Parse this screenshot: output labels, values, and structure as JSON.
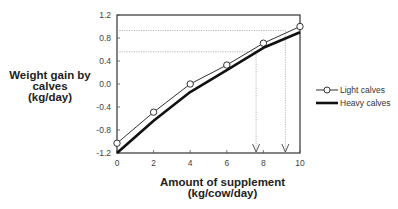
{
  "chart_data": {
    "type": "line",
    "title": "",
    "xlabel": "Amount of supplement (kg/cow/day)",
    "ylabel": "Weight gain by calves (kg/day)",
    "xlabel_lines": [
      "Amount of supplement",
      "(kg/cow/day)"
    ],
    "ylabel_lines": [
      "Weight gain by",
      "calves",
      "(kg/day)"
    ],
    "x": [
      0,
      2,
      4,
      6,
      8,
      10
    ],
    "xlim": [
      0,
      10
    ],
    "ylim": [
      -1.2,
      1.2
    ],
    "xticks": [
      "0",
      "2",
      "4",
      "6",
      "8",
      "10"
    ],
    "yticks": [
      "1.2",
      "0.8",
      "0.4",
      "0.0",
      "-0.4",
      "-0.8",
      "-1.2"
    ],
    "grid": false,
    "legend_position": "right",
    "series": [
      {
        "name": "Light calves",
        "marker": "circle",
        "line": "thin",
        "values": [
          -1.03,
          -0.49,
          0.0,
          0.33,
          0.71,
          1.0
        ]
      },
      {
        "name": "Heavy calves",
        "marker": "none",
        "line": "thick",
        "values": [
          -1.2,
          -0.64,
          -0.14,
          0.24,
          0.63,
          0.9
        ]
      }
    ],
    "annotations": [
      {
        "type": "reference-line",
        "y": 0.93,
        "x_end": 9.2,
        "style": "dotted",
        "arrow_down_at_x": 9.2
      },
      {
        "type": "reference-line",
        "y": 0.56,
        "x_end": 7.6,
        "style": "dotted",
        "arrow_down_at_x": 7.6
      }
    ]
  }
}
